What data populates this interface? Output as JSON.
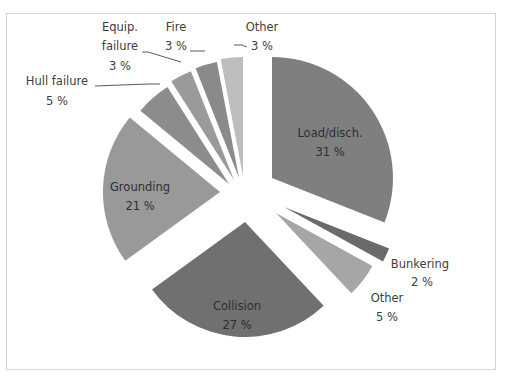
{
  "chart_data": {
    "type": "pie",
    "title": "",
    "exploded": true,
    "start_angle_deg": 0,
    "direction": "clockwise",
    "slices": [
      {
        "label": "Load/disch.",
        "value": 31,
        "value_label": "31 %",
        "color": "#7f7f7f",
        "apex": [
          272,
          178
        ],
        "radius": 121,
        "label_pos": [
          330,
          140
        ],
        "label_inside": true
      },
      {
        "label": "Bunkering",
        "value": 2,
        "value_label": "2 %",
        "color": "#6a6a6a",
        "apex": [
          284,
          207
        ],
        "radius": 113,
        "label_pos": [
          420,
          266
        ],
        "label_inside": false
      },
      {
        "label": "Other",
        "value": 5,
        "value_label": "5 %",
        "color": "#a6a6a6",
        "apex": [
          276,
          213
        ],
        "radius": 110,
        "label_pos": [
          385,
          301
        ],
        "label_inside": false
      },
      {
        "label": "Collision",
        "value": 27,
        "value_label": "27 %",
        "color": "#707070",
        "apex": [
          245,
          222
        ],
        "radius": 115,
        "label_pos": [
          237,
          312
        ],
        "label_inside": true
      },
      {
        "label": "Grounding",
        "value": 21,
        "value_label": "21 %",
        "color": "#999999",
        "apex": [
          220,
          192
        ],
        "radius": 117,
        "label_pos": [
          142,
          191
        ],
        "label_inside": true
      },
      {
        "label": "Hull failure",
        "value": 5,
        "value_label": "5 %",
        "color": "#8c8c8c",
        "apex": [
          229,
          184
        ],
        "radius": 115,
        "label_pos": [
          55,
          82
        ],
        "label_inside": false
      },
      {
        "label": "Equip. failure",
        "value": 3,
        "value_label": "3 %",
        "color": "#9a9a9a",
        "apex": [
          234,
          180
        ],
        "radius": 117,
        "label_pos": [
          118,
          30
        ],
        "label_inside": false
      },
      {
        "label": "Fire",
        "value": 3,
        "value_label": "3 %",
        "color": "#8a8a8a",
        "apex": [
          239,
          178
        ],
        "radius": 118,
        "label_pos": [
          178,
          30
        ],
        "label_inside": false
      },
      {
        "label": "Other",
        "value": 3,
        "value_label": "3 %",
        "color": "#bdbdbd",
        "apex": [
          243,
          176
        ],
        "radius": 119,
        "label_pos": [
          250,
          30
        ],
        "label_inside": false
      }
    ]
  },
  "labels": {
    "load": {
      "name": "Load/disch.",
      "pct": "31 %"
    },
    "bunkering": {
      "name": "Bunkering",
      "pct": "2 %"
    },
    "other_right": {
      "name": "Other",
      "pct": "5 %"
    },
    "collision": {
      "name": "Collision",
      "pct": "27 %"
    },
    "grounding": {
      "name": "Grounding",
      "pct": "21 %"
    },
    "hull": {
      "name": "Hull failure",
      "pct": "5 %"
    },
    "equip": {
      "name1": "Equip.",
      "name2": "failure",
      "pct": "3 %"
    },
    "fire": {
      "name": "Fire",
      "pct": "3 %"
    },
    "other_top": {
      "name": "Other",
      "pct": "3 %"
    }
  }
}
